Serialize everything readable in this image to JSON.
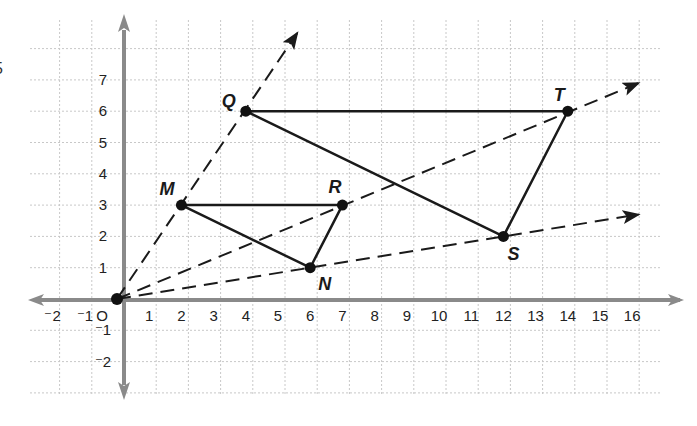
{
  "figure": {
    "title": "",
    "edge_fragment": "5",
    "axes": {
      "x_ticks": [
        "⁻2",
        "⁻1",
        "O",
        "1",
        "2",
        "3",
        "4",
        "5",
        "6",
        "7",
        "8",
        "9",
        "10",
        "11",
        "12",
        "13",
        "14",
        "15",
        "16"
      ],
      "x_values": [
        -2,
        -1,
        0,
        1,
        2,
        3,
        4,
        5,
        6,
        7,
        8,
        9,
        10,
        11,
        12,
        13,
        14,
        15,
        16
      ],
      "y_ticks": [
        "7",
        "6",
        "5",
        "4",
        "3",
        "2",
        "1",
        "⁻1",
        "⁻2"
      ],
      "y_values": [
        7,
        6,
        5,
        4,
        3,
        2,
        1,
        -1,
        -2
      ],
      "xlim": [
        -3,
        17
      ],
      "ylim": [
        -3,
        8
      ],
      "grid": true,
      "axis_color": "#8a8a8a",
      "grid_color": "#c8c8c8"
    },
    "points": [
      {
        "label": "O",
        "x": 0,
        "y": 0,
        "show_label": false
      },
      {
        "label": "M",
        "x": 2,
        "y": 3,
        "show_label": true,
        "label_dx": -22,
        "label_dy": -10
      },
      {
        "label": "N",
        "x": 6,
        "y": 1,
        "show_label": true,
        "label_dx": 8,
        "label_dy": 22
      },
      {
        "label": "R",
        "x": 7,
        "y": 3,
        "show_label": true,
        "label_dx": -14,
        "label_dy": -12
      },
      {
        "label": "Q",
        "x": 4,
        "y": 6,
        "show_label": true,
        "label_dx": -24,
        "label_dy": -4
      },
      {
        "label": "S",
        "x": 12,
        "y": 2,
        "show_label": true,
        "label_dx": 4,
        "label_dy": 24
      },
      {
        "label": "T",
        "x": 14,
        "y": 6,
        "show_label": true,
        "label_dx": -14,
        "label_dy": -10
      }
    ],
    "triangles": [
      {
        "name": "MNR",
        "vertices": [
          "M",
          "N",
          "R"
        ]
      },
      {
        "name": "QST",
        "vertices": [
          "Q",
          "S",
          "T"
        ]
      }
    ],
    "rays": [
      {
        "from": "O",
        "through": "Q",
        "to": [
          5.6,
          8.5
        ]
      },
      {
        "from": "O",
        "through": "T",
        "to": [
          16.2,
          6.9
        ]
      },
      {
        "from": "O",
        "through": "S",
        "to": [
          16.2,
          2.7
        ]
      }
    ],
    "colors": {
      "line": "#1a1a1a",
      "point": "#111111",
      "label": "#1a1a1a"
    }
  }
}
